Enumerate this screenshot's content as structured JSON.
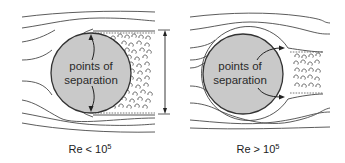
{
  "figure": {
    "left_panel": {
      "caption_prefix": "Re < 10",
      "caption_exponent": "5",
      "inner_label_line1": "points of",
      "inner_label_line2": "separation",
      "regime": "laminar boundary layer, wide turbulent wake",
      "wake_width_marker": "double-headed arrow spanning wake width"
    },
    "right_panel": {
      "caption_prefix": "Re > 10",
      "caption_exponent": "5",
      "inner_label_line1": "points of",
      "inner_label_line2": "separation",
      "regime": "turbulent boundary layer, narrow wake"
    },
    "colors": {
      "cylinder_fill": "#c9c9c9",
      "line": "#444444",
      "background": "#ffffff"
    }
  }
}
